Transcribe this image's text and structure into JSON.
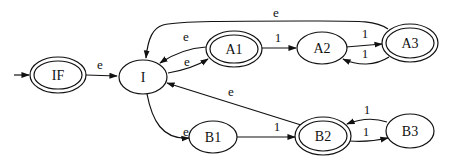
{
  "diagram": {
    "type": "state-machine",
    "start_state": "IF",
    "nodes": [
      {
        "id": "IF",
        "label": "IF",
        "accepting": true,
        "cx": 58,
        "cy": 75,
        "rx": 27,
        "ry": 17
      },
      {
        "id": "I",
        "label": "I",
        "accepting": false,
        "cx": 143,
        "cy": 77,
        "rx": 24,
        "ry": 17
      },
      {
        "id": "A1",
        "label": "A1",
        "accepting": true,
        "cx": 234,
        "cy": 49,
        "rx": 26,
        "ry": 17
      },
      {
        "id": "A2",
        "label": "A2",
        "accepting": false,
        "cx": 322,
        "cy": 48,
        "rx": 24,
        "ry": 16
      },
      {
        "id": "A3",
        "label": "A3",
        "accepting": true,
        "cx": 410,
        "cy": 43,
        "rx": 26,
        "ry": 18
      },
      {
        "id": "B1",
        "label": "B1",
        "accepting": false,
        "cx": 213,
        "cy": 137,
        "rx": 24,
        "ry": 16
      },
      {
        "id": "B2",
        "label": "B2",
        "accepting": true,
        "cx": 323,
        "cy": 136,
        "rx": 26,
        "ry": 18
      },
      {
        "id": "B3",
        "label": "B3",
        "accepting": false,
        "cx": 410,
        "cy": 131,
        "rx": 24,
        "ry": 17
      }
    ],
    "edges": [
      {
        "from": "start",
        "to": "IF",
        "label": ""
      },
      {
        "from": "IF",
        "to": "I",
        "label": "e"
      },
      {
        "from": "I",
        "to": "A1",
        "label": "e"
      },
      {
        "from": "A1",
        "to": "I",
        "label": "e"
      },
      {
        "from": "A1",
        "to": "A2",
        "label": "1"
      },
      {
        "from": "A2",
        "to": "A3",
        "label": "1"
      },
      {
        "from": "A3",
        "to": "A2",
        "label": "1"
      },
      {
        "from": "A3",
        "to": "I",
        "label": "e"
      },
      {
        "from": "I",
        "to": "B1",
        "label": "e"
      },
      {
        "from": "B1",
        "to": "B2",
        "label": "1"
      },
      {
        "from": "B2",
        "to": "I",
        "label": "e"
      },
      {
        "from": "B2",
        "to": "B3",
        "label": "1"
      },
      {
        "from": "B3",
        "to": "B2",
        "label": "1"
      }
    ]
  }
}
